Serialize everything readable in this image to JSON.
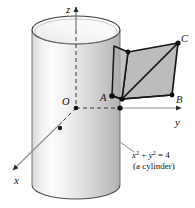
{
  "figure": {
    "axes": {
      "z_label": "z",
      "y_label": "y",
      "x_label": "x"
    },
    "origin": {
      "label": "O"
    },
    "points": [
      {
        "id": "A",
        "label": "A"
      },
      {
        "id": "B",
        "label": "B"
      },
      {
        "id": "C",
        "label": "C"
      }
    ],
    "annotation": {
      "equation_x": "x",
      "equation_x_exp": "2",
      "equation_plus": " + ",
      "equation_y": "y",
      "equation_y_exp": "2",
      "equation_eq": " = 4",
      "equation_plain": "x2 + y2 = 4",
      "caption": "(a cylinder)"
    },
    "colors": {
      "stroke": "#141414",
      "axis_line": "#6b6b6b",
      "cylinder_light": "#fdfdfd",
      "cylinder_mid": "#e6e6e6",
      "cylinder_dark": "#b9b9b9",
      "cylinder_top": "#f2f2f2",
      "patch_fill": "#b4b4b4",
      "background": "#ffffff"
    }
  }
}
